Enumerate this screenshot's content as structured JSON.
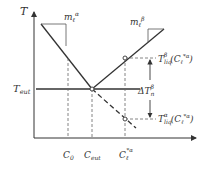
{
  "diagram": {
    "type": "phase-diagram",
    "axes": {
      "y_label": "T",
      "x_ticks": [
        {
          "id": "c0",
          "base": "C",
          "sub": "0",
          "sup": ""
        },
        {
          "id": "ceut",
          "base": "C",
          "sub": "eut",
          "sup": ""
        },
        {
          "id": "cl",
          "base": "C",
          "sub": "ℓ",
          "sup": "*α"
        }
      ]
    },
    "labels": {
      "t_eut": {
        "base": "T",
        "sub": "eut"
      },
      "slope_alpha": {
        "base": "m",
        "sub": "ℓ",
        "sup": "α"
      },
      "slope_beta": {
        "base": "m",
        "sub": "ℓ",
        "sup": "β"
      },
      "t_liq_beta": {
        "base": "T",
        "sub": "liq",
        "sup": "β",
        "arg_base": "(C",
        "arg_sub": "ℓ",
        "arg_sup": "*α",
        "arg_close": ")"
      },
      "t_liq_alpha": {
        "base": "T",
        "sub": "liq",
        "sup": "α",
        "arg_base": "(C",
        "arg_sub": "ℓ",
        "arg_sup": "*α",
        "arg_close": ")"
      },
      "delta_t": {
        "base": "ΔT",
        "sub": "n",
        "sup": "β"
      }
    },
    "colors": {
      "line": "#333333",
      "dashed": "#555555"
    }
  }
}
